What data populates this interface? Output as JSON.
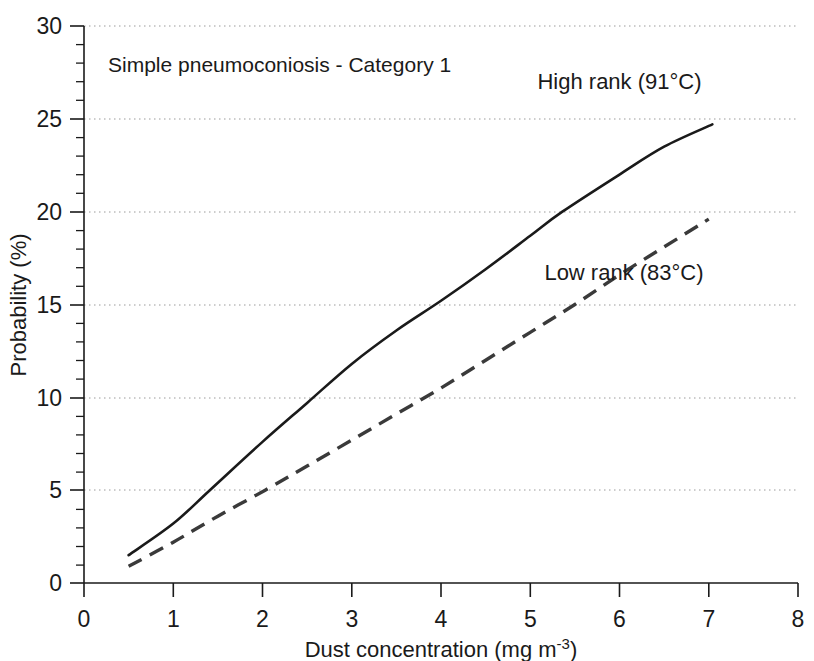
{
  "chart_data": {
    "type": "line",
    "title": "",
    "annotation": "Simple pneumoconiosis - Category 1",
    "xlabel_main": "Dust concentration (mg m",
    "xlabel_sup": "-3",
    "xlabel_tail": ")",
    "xlabel": "Dust concentration (mg m-3)",
    "ylabel": "Probability (%)",
    "xlim": [
      0,
      8
    ],
    "ylim": [
      0,
      30
    ],
    "x_ticks": [
      "0",
      "1",
      "2",
      "3",
      "4",
      "5",
      "6",
      "7",
      "8"
    ],
    "x_tick_values": [
      0,
      1,
      2,
      3,
      4,
      5,
      6,
      7,
      8
    ],
    "y_ticks": [
      "0",
      "5",
      "10",
      "15",
      "20",
      "25",
      "30"
    ],
    "y_tick_values": [
      0,
      5,
      10,
      15,
      20,
      25,
      30
    ],
    "y_minor_interval": 1,
    "grid": "horizontal-dotted",
    "legend_position": "inline-right",
    "series": [
      {
        "name": "High rank (91°C)",
        "style": "solid",
        "color": "#1a1a1a",
        "label_x": 6.0,
        "label_y": 26.6,
        "x": [
          0.5,
          1.0,
          1.41,
          2.0,
          2.5,
          3.0,
          3.5,
          4.0,
          4.5,
          5.0,
          5.36,
          6.0,
          6.5,
          7.04
        ],
        "y": [
          1.5,
          3.2,
          5.0,
          7.6,
          9.7,
          11.8,
          13.6,
          15.2,
          16.9,
          18.7,
          20.0,
          22.0,
          23.5,
          24.7
        ]
      },
      {
        "name": "Low rank (83°C)",
        "style": "dashed",
        "color": "#3a3a3a",
        "label_x": 6.05,
        "label_y": 16.3,
        "x": [
          0.5,
          1.0,
          1.5,
          2.03,
          2.5,
          3.0,
          3.5,
          4.0,
          4.5,
          5.0,
          5.5,
          6.0,
          6.5,
          7.0
        ],
        "y": [
          0.9,
          2.2,
          3.6,
          5.0,
          6.3,
          7.7,
          9.1,
          10.5,
          12.0,
          13.5,
          15.0,
          16.6,
          18.1,
          19.6
        ]
      }
    ]
  },
  "axes": {
    "left_px": 84,
    "right_px": 798,
    "top_px": 26,
    "bottom_px": 583
  }
}
